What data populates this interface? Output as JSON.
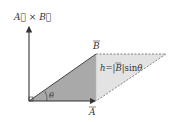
{
  "diagram": {
    "labels": {
      "cross_product": "A⃗ × B⃗",
      "vector_a": "A",
      "vector_b": "B",
      "angle": "θ",
      "height_prefix": "h=|",
      "height_b": "B",
      "height_suffix": "|sin",
      "height_theta": "θ"
    },
    "colors": {
      "dark_fill": "#a9a9a9",
      "light_fill": "#e3e3e3",
      "stroke": "#444444",
      "dashed": "#666666"
    },
    "points": {
      "origin": [
        29,
        101
      ],
      "a_tip": [
        96,
        101
      ],
      "b_tip": [
        96,
        54
      ],
      "far_vertex": [
        166,
        54
      ],
      "z_tip": [
        29,
        25
      ]
    }
  }
}
